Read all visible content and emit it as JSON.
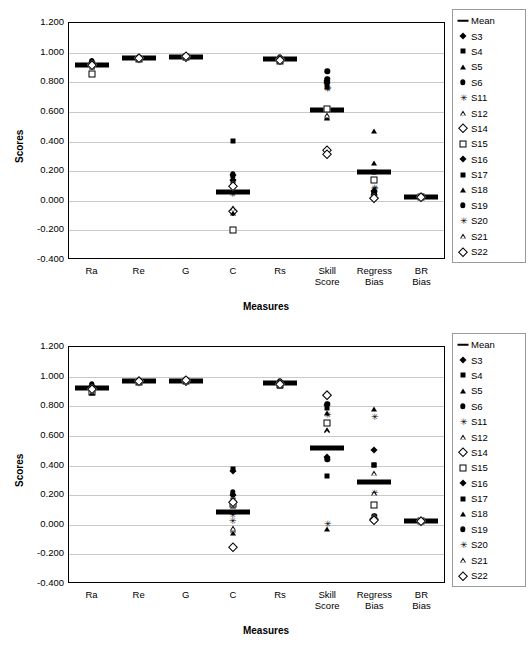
{
  "chart_data": [
    {
      "type": "scatter",
      "title": "",
      "xlabel": "Measures",
      "ylabel": "Scores",
      "ylim": [
        -0.4,
        1.2
      ],
      "ytick_labels": [
        "1.200",
        "1.000",
        "0.800",
        "0.600",
        "0.400",
        "0.200",
        "0.000",
        "-0.200",
        "-0.400"
      ],
      "ytick_values": [
        1.2,
        1.0,
        0.8,
        0.6,
        0.4,
        0.2,
        0.0,
        -0.2,
        -0.4
      ],
      "grid": true,
      "legend_position": "right",
      "categories": [
        "Ra",
        "Re",
        "G",
        "C",
        "Rs",
        "Skill Score",
        "Regress Bias",
        "BR Bias"
      ],
      "series": [
        {
          "name": "Mean",
          "marker": "dash",
          "values": [
            0.912,
            0.957,
            0.967,
            0.05,
            0.948,
            0.608,
            0.186,
            0.02
          ]
        },
        {
          "name": "S3",
          "marker": "fdiamond",
          "values": [
            0.93,
            0.96,
            0.97,
            0.135,
            0.955,
            0.79,
            0.06,
            0.021
          ]
        },
        {
          "name": "S4",
          "marker": "fsquare",
          "values": [
            0.905,
            0.955,
            0.968,
            0.398,
            0.945,
            0.805,
            0.045,
            0.02
          ]
        },
        {
          "name": "S5",
          "marker": "ftriangle",
          "values": [
            0.918,
            0.958,
            0.966,
            0.105,
            0.95,
            0.76,
            0.248,
            0.019
          ]
        },
        {
          "name": "S6",
          "marker": "fcircle",
          "values": [
            0.94,
            0.962,
            0.972,
            0.158,
            0.962,
            0.868,
            0.035,
            0.022
          ]
        },
        {
          "name": "S11",
          "marker": "star",
          "values": [
            0.9,
            0.953,
            0.964,
            0.045,
            0.94,
            0.755,
            0.075,
            0.02
          ]
        },
        {
          "name": "S12",
          "marker": "otriangle",
          "values": [
            0.908,
            0.955,
            0.965,
            -0.062,
            0.942,
            0.56,
            0.02,
            0.018
          ]
        },
        {
          "name": "S14",
          "marker": "odiamond",
          "values": [
            0.915,
            0.957,
            0.967,
            -0.075,
            0.947,
            0.338,
            0.015,
            0.02
          ]
        },
        {
          "name": "S15",
          "marker": "osquare",
          "values": [
            0.848,
            0.95,
            0.962,
            -0.205,
            0.935,
            0.612,
            0.13,
            0.017
          ]
        },
        {
          "name": "S16",
          "marker": "fdiamond",
          "values": [
            0.925,
            0.959,
            0.969,
            0.165,
            0.952,
            0.8,
            0.03,
            0.021
          ]
        },
        {
          "name": "S17",
          "marker": "fsquare",
          "values": [
            0.91,
            0.956,
            0.967,
            0.12,
            0.948,
            0.775,
            0.19,
            0.02
          ]
        },
        {
          "name": "S18",
          "marker": "ftriangle",
          "values": [
            0.895,
            0.952,
            0.963,
            -0.09,
            0.938,
            0.552,
            0.465,
            0.018
          ]
        },
        {
          "name": "S19",
          "marker": "fcircle",
          "values": [
            0.935,
            0.961,
            0.971,
            0.175,
            0.958,
            0.818,
            0.055,
            0.022
          ]
        },
        {
          "name": "S20",
          "marker": "star",
          "values": [
            0.902,
            0.954,
            0.965,
            0.04,
            0.944,
            0.745,
            0.082,
            0.019
          ]
        },
        {
          "name": "S21",
          "marker": "otriangle",
          "values": [
            0.906,
            0.955,
            0.966,
            -0.058,
            0.943,
            0.575,
            0.025,
            0.018
          ]
        },
        {
          "name": "S22",
          "marker": "odiamond",
          "values": [
            0.912,
            0.957,
            0.968,
            0.095,
            0.946,
            0.312,
            0.012,
            0.02
          ]
        }
      ]
    },
    {
      "type": "scatter",
      "title": "",
      "xlabel": "Measures",
      "ylabel": "Scores",
      "ylim": [
        -0.4,
        1.2
      ],
      "ytick_labels": [
        "1.200",
        "1.000",
        "0.800",
        "0.600",
        "0.400",
        "0.200",
        "0.000",
        "-0.200",
        "-0.400"
      ],
      "ytick_values": [
        1.2,
        1.0,
        0.8,
        0.6,
        0.4,
        0.2,
        0.0,
        -0.2,
        -0.4
      ],
      "grid": true,
      "legend_position": "right",
      "categories": [
        "Ra",
        "Re",
        "G",
        "C",
        "Rs",
        "Skill Score",
        "Regress Bias",
        "BR Bias"
      ],
      "series": [
        {
          "name": "Mean",
          "marker": "dash",
          "values": [
            0.915,
            0.965,
            0.967,
            0.078,
            0.948,
            0.51,
            0.285,
            0.018
          ]
        },
        {
          "name": "S3",
          "marker": "fdiamond",
          "values": [
            0.93,
            0.968,
            0.972,
            0.195,
            0.955,
            0.8,
            0.5,
            0.019
          ]
        },
        {
          "name": "S4",
          "marker": "fsquare",
          "values": [
            0.905,
            0.963,
            0.965,
            0.16,
            0.945,
            0.78,
            0.4,
            0.018
          ]
        },
        {
          "name": "S5",
          "marker": "ftriangle",
          "values": [
            0.9,
            0.962,
            0.963,
            0.12,
            0.94,
            0.745,
            0.775,
            0.017
          ]
        },
        {
          "name": "S6",
          "marker": "fcircle",
          "values": [
            0.945,
            0.97,
            0.975,
            0.215,
            0.965,
            0.808,
            0.055,
            0.02
          ]
        },
        {
          "name": "S11",
          "marker": "star",
          "values": [
            0.918,
            0.966,
            0.968,
            0.06,
            0.95,
            0.735,
            0.72,
            0.018
          ]
        },
        {
          "name": "S12",
          "marker": "otriangle",
          "values": [
            0.908,
            0.964,
            0.966,
            -0.04,
            0.944,
            0.635,
            0.34,
            0.017
          ]
        },
        {
          "name": "S14",
          "marker": "odiamond",
          "values": [
            0.912,
            0.965,
            0.967,
            -0.16,
            0.946,
            0.868,
            0.03,
            0.018
          ]
        },
        {
          "name": "S15",
          "marker": "osquare",
          "values": [
            0.89,
            0.96,
            0.962,
            0.13,
            0.935,
            0.68,
            0.125,
            0.016
          ]
        },
        {
          "name": "S16",
          "marker": "fdiamond",
          "values": [
            0.928,
            0.967,
            0.97,
            0.355,
            0.953,
            0.452,
            0.04,
            0.019
          ]
        },
        {
          "name": "S17",
          "marker": "fsquare",
          "values": [
            0.91,
            0.964,
            0.966,
            0.37,
            0.947,
            0.325,
            0.395,
            0.018
          ]
        },
        {
          "name": "S18",
          "marker": "ftriangle",
          "values": [
            0.885,
            0.959,
            0.961,
            -0.06,
            0.93,
            -0.035,
            0.025,
            0.016
          ]
        },
        {
          "name": "S19",
          "marker": "fcircle",
          "values": [
            0.94,
            0.969,
            0.973,
            0.2,
            0.96,
            0.435,
            0.035,
            0.02
          ]
        },
        {
          "name": "S20",
          "marker": "star",
          "values": [
            0.915,
            0.965,
            0.967,
            0.018,
            0.948,
            -0.005,
            0.21,
            0.018
          ]
        },
        {
          "name": "S21",
          "marker": "otriangle",
          "values": [
            0.906,
            0.963,
            0.965,
            -0.03,
            0.943,
            0.63,
            0.205,
            0.017
          ]
        },
        {
          "name": "S22",
          "marker": "odiamond",
          "values": [
            0.913,
            0.965,
            0.968,
            0.145,
            0.946,
            0.87,
            0.022,
            0.018
          ]
        }
      ]
    }
  ]
}
